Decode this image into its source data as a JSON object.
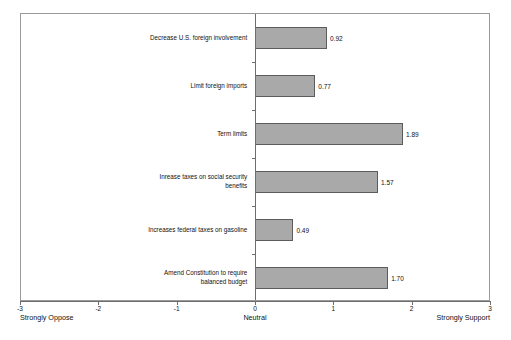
{
  "chart_data": {
    "type": "bar",
    "orientation": "horizontal",
    "title": "",
    "xlabel": "",
    "ylabel": "",
    "xlim": [
      -3,
      3
    ],
    "xticks": [
      -3,
      -2,
      -1,
      0,
      1,
      2,
      3
    ],
    "xtick_labels": [
      "-3",
      "-2",
      "-1",
      "0",
      "1",
      "2",
      "3"
    ],
    "grid": false,
    "legend": null,
    "axis_anchors": {
      "left": "Strongly Oppose",
      "middle": "Neutral",
      "right": "Strongly Support"
    },
    "categories": [
      "Decrease U.S. foreign involvement",
      "Limit foreign imports",
      "Term limits",
      "Inrease taxes on social security\nbenefits",
      "Increases federal taxes on gasoline",
      "Amend Constitution to require\nbalanced budget"
    ],
    "values": [
      0.92,
      0.77,
      1.89,
      1.57,
      0.49,
      1.7
    ],
    "value_labels": [
      "0.92",
      "0.77",
      "1.89",
      "1.57",
      "0.49",
      "1.70"
    ],
    "bar_color": "#a9a9a9",
    "bar_edge_color": "#5c5c5c",
    "axis_color": "#6d6d6d"
  }
}
